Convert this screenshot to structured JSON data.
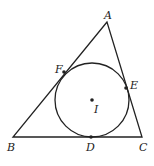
{
  "diagram": {
    "type": "triangle-incircle",
    "colors": {
      "stroke": "#222222",
      "background": "#ffffff"
    },
    "vertices": {
      "A": {
        "label": "A",
        "x": 107,
        "y": 22
      },
      "B": {
        "label": "B",
        "x": 13,
        "y": 137
      },
      "C": {
        "label": "C",
        "x": 142,
        "y": 137
      }
    },
    "incircle": {
      "center_label": "I",
      "cx": 92,
      "cy": 100,
      "r": 37
    },
    "tangent_points": {
      "D": {
        "label": "D",
        "x": 91,
        "y": 137
      },
      "E": {
        "label": "E",
        "x": 126,
        "y": 88
      },
      "F": {
        "label": "F",
        "x": 64,
        "y": 72
      }
    }
  }
}
